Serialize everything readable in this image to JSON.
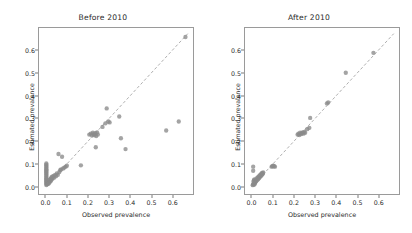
{
  "figure": {
    "background": "#ffffff",
    "marker_color": "#8a8a8a",
    "refline_color": "#9a9a9a",
    "frame_color": "#9a9a9a"
  },
  "chart_data": [
    {
      "type": "scatter",
      "title": "Before 2010",
      "xlabel": "Observed prevalence",
      "ylabel": "Estimated prevalence",
      "xlim": [
        -0.035,
        0.7
      ],
      "ylim": [
        -0.035,
        0.7
      ],
      "xticks": [
        0.0,
        0.1,
        0.2,
        0.3,
        0.4,
        0.5,
        0.6
      ],
      "xticklabels": [
        "0.0",
        "0.1",
        "0.2",
        "0.3",
        "0.4",
        "0.5",
        "0.6"
      ],
      "yticks": [
        0.0,
        0.1,
        0.2,
        0.3,
        0.4,
        0.5,
        0.6
      ],
      "yticklabels": [
        "0.0",
        "0.1",
        "0.2",
        "0.3",
        "0.4",
        "0.5",
        "0.6"
      ],
      "grid": false,
      "legend": null,
      "reference_line": {
        "type": "identity",
        "style": "dashed",
        "from": [
          0.0,
          0.0
        ],
        "to": [
          0.675,
          0.675
        ]
      },
      "x": [
        0.0,
        0.0,
        0.0,
        0.0,
        0.0,
        0.0,
        0.0,
        0.0,
        0.0,
        0.0,
        0.0,
        0.0,
        0.0,
        0.0,
        0.0,
        0.0,
        0.0,
        0.0,
        0.0,
        0.0,
        0.004,
        0.006,
        0.008,
        0.01,
        0.012,
        0.014,
        0.016,
        0.018,
        0.02,
        0.022,
        0.024,
        0.026,
        0.028,
        0.03,
        0.034,
        0.038,
        0.042,
        0.046,
        0.05,
        0.055,
        0.058,
        0.062,
        0.066,
        0.07,
        0.075,
        0.08,
        0.086,
        0.092,
        0.098,
        0.165,
        0.205,
        0.212,
        0.218,
        0.222,
        0.226,
        0.23,
        0.234,
        0.238,
        0.242,
        0.246,
        0.236,
        0.268,
        0.282,
        0.296,
        0.302,
        0.348,
        0.356,
        0.378,
        0.288,
        0.572,
        0.632,
        0.664
      ],
      "y": [
        0.005,
        0.01,
        0.015,
        0.02,
        0.025,
        0.03,
        0.035,
        0.04,
        0.045,
        0.05,
        0.055,
        0.06,
        0.065,
        0.07,
        0.075,
        0.08,
        0.085,
        0.09,
        0.095,
        0.1,
        0.008,
        0.012,
        0.018,
        0.01,
        0.022,
        0.015,
        0.028,
        0.02,
        0.032,
        0.024,
        0.038,
        0.03,
        0.042,
        0.034,
        0.045,
        0.038,
        0.05,
        0.044,
        0.056,
        0.05,
        0.142,
        0.062,
        0.07,
        0.074,
        0.13,
        0.078,
        0.082,
        0.086,
        0.09,
        0.092,
        0.228,
        0.232,
        0.224,
        0.236,
        0.23,
        0.226,
        0.234,
        0.222,
        0.238,
        0.228,
        0.172,
        0.262,
        0.278,
        0.286,
        0.282,
        0.308,
        0.212,
        0.164,
        0.344,
        0.246,
        0.286,
        0.66
      ]
    },
    {
      "type": "scatter",
      "title": "After 2010",
      "xlabel": "Observed prevalence",
      "ylabel": "Estimated prevalence",
      "xlim": [
        -0.035,
        0.7
      ],
      "ylim": [
        -0.035,
        0.7
      ],
      "xticks": [
        0.0,
        0.1,
        0.2,
        0.3,
        0.4,
        0.5,
        0.6
      ],
      "xticklabels": [
        "0.0",
        "0.1",
        "0.2",
        "0.3",
        "0.4",
        "0.5",
        "0.6"
      ],
      "yticks": [
        0.0,
        0.1,
        0.2,
        0.3,
        0.4,
        0.5,
        0.6
      ],
      "yticklabels": [
        "0.0",
        "0.1",
        "0.2",
        "0.3",
        "0.4",
        "0.5",
        "0.6"
      ],
      "grid": false,
      "legend": null,
      "reference_line": {
        "type": "identity",
        "style": "dashed",
        "from": [
          0.0,
          0.0
        ],
        "to": [
          0.675,
          0.675
        ]
      },
      "x": [
        0.002,
        0.004,
        0.006,
        0.008,
        0.01,
        0.012,
        0.014,
        0.006,
        0.008,
        0.01,
        0.014,
        0.018,
        0.02,
        0.022,
        0.026,
        0.028,
        0.03,
        0.032,
        0.034,
        0.036,
        0.038,
        0.04,
        0.042,
        0.044,
        0.046,
        0.048,
        0.05,
        0.052,
        0.004,
        0.004,
        0.092,
        0.096,
        0.1,
        0.104,
        0.108,
        0.216,
        0.22,
        0.224,
        0.228,
        0.232,
        0.236,
        0.24,
        0.244,
        0.248,
        0.252,
        0.262,
        0.272,
        0.276,
        0.356,
        0.362,
        0.446,
        0.578
      ],
      "y": [
        0.004,
        0.008,
        0.01,
        0.006,
        0.014,
        0.01,
        0.018,
        0.022,
        0.026,
        0.03,
        0.016,
        0.022,
        0.034,
        0.026,
        0.038,
        0.03,
        0.042,
        0.036,
        0.046,
        0.04,
        0.05,
        0.044,
        0.054,
        0.048,
        0.058,
        0.052,
        0.056,
        0.06,
        0.068,
        0.086,
        0.086,
        0.088,
        0.09,
        0.088,
        0.086,
        0.228,
        0.232,
        0.226,
        0.236,
        0.23,
        0.234,
        0.238,
        0.232,
        0.24,
        0.236,
        0.252,
        0.258,
        0.302,
        0.366,
        0.37,
        0.502,
        0.59
      ]
    }
  ]
}
